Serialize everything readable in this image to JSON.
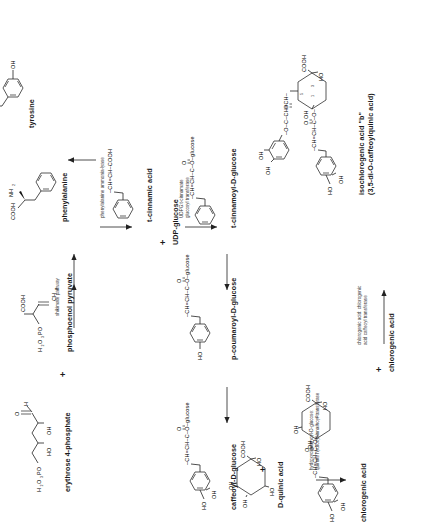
{
  "diagram": {
    "orientation": "rotated-90-ccw",
    "background_color": "#ffffff",
    "line_color": "#222222"
  },
  "compounds": [
    {
      "id": "erythrose4p",
      "name": "erythrose 4-phosphate",
      "formula_parts": [
        "H₂O₃PO",
        "OH",
        "HO",
        "H",
        "O"
      ]
    },
    {
      "id": "pep",
      "name": "phosphoenol pyruvate",
      "formula_parts": [
        "H₂O₃PO",
        "COOH",
        "CH₂"
      ]
    },
    {
      "id": "phenylalanine",
      "name": "phenylalanine",
      "formula_parts": [
        "COOH",
        "NH₂"
      ]
    },
    {
      "id": "tyrosine",
      "name": "tyrosine",
      "formula_parts": [
        "COOH",
        "NH₂",
        "OH"
      ]
    },
    {
      "id": "tcinnamic",
      "name": "t-cinnamic acid",
      "formula_parts": [
        "–CH=CH–COOH"
      ]
    },
    {
      "id": "udpglucose",
      "name": "UDP-glucose",
      "formula_parts": []
    },
    {
      "id": "tcinnamoylglc",
      "name": "t-cinnamoyl-D-glucose",
      "formula_parts": [
        "–CH=CH–C–O–glucose",
        "O"
      ]
    },
    {
      "id": "pcoumaroylglc",
      "name": "p-coumaroyl-D-glucose",
      "formula_parts": [
        "–CH=CH–C–O–glucose",
        "O",
        "HO"
      ]
    },
    {
      "id": "caffeoylglc",
      "name": "caffeoyl-D-glucose",
      "formula_parts": [
        "–CH=CH–C–O–glucose",
        "O",
        "HO",
        "OH"
      ]
    },
    {
      "id": "dquinic",
      "name": "D-quinic acid",
      "formula_parts": [
        "OH",
        "OH",
        "HO",
        "HO",
        "COOH"
      ]
    },
    {
      "id": "chlorogenic",
      "name": "chlorogenic acid",
      "formula_parts": [
        "OH",
        "OH",
        "HO",
        "HO",
        "COOH",
        "O"
      ]
    },
    {
      "id": "chlorogenic2",
      "name": "chlorogenic acid",
      "formula_parts": []
    },
    {
      "id": "isochlorogenic",
      "name": "isochlorogenic acid \"b\"",
      "name2": "(3,5-di-O-caffeoylquinic acid)",
      "formula_parts": [
        "OH",
        "OH",
        "HO",
        "COOH"
      ]
    }
  ],
  "enzymes": [
    {
      "id": "shikimate",
      "label": "shikimate pathway"
    },
    {
      "id": "pal",
      "label": "phenylalanine ammonia-lyase"
    },
    {
      "id": "udpg_gt",
      "line1": "UDPG:t-cinnamate",
      "line2": "glucosyl transferase"
    },
    {
      "id": "hcgqt",
      "line1": "hydroxycinnamoyl-D-glucose:",
      "line2": "quinate hydroxycinnamoyl transferase"
    },
    {
      "id": "cacat",
      "line1": "chlorogenic acid: chlorogenic",
      "line2": "acid caffeoyl transferase"
    }
  ],
  "operators": [
    {
      "id": "plus1",
      "symbol": "+"
    },
    {
      "id": "plus2",
      "symbol": "+"
    },
    {
      "id": "plus3",
      "symbol": "+"
    },
    {
      "id": "plus4",
      "symbol": "+"
    }
  ],
  "atom_labels": {
    "cooh": "COOH",
    "nh2": "NH₂",
    "oh": "OH",
    "ho": "HO",
    "h": "H",
    "o": "O",
    "ch2": "CH₂",
    "h2o3po": "H₂O₃PO",
    "cinnamate_chain": "–CH=CH–COOH",
    "ester_chain": "–CH=CH–C–O–glucose",
    "ester_chain2": "–CH=CH–C–O–",
    "chch": "CH=CH",
    "quinate_nums": [
      "1",
      "3",
      "4",
      "5"
    ]
  }
}
